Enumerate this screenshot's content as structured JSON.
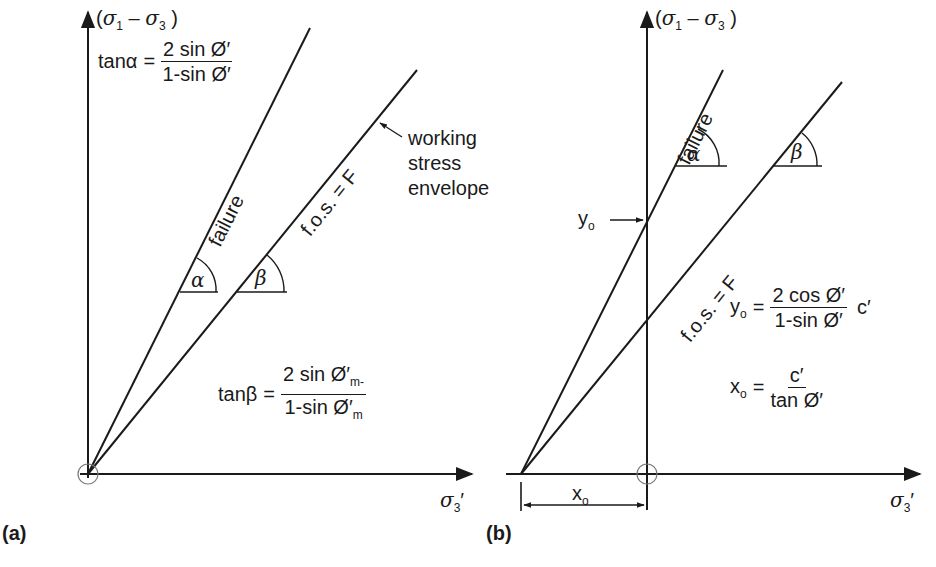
{
  "panels": {
    "a": {
      "label": "(a)",
      "y_axis_label": {
        "open": "(",
        "s1": "σ",
        "s1_sub": "1",
        "minus": " – ",
        "s3": "σ",
        "s3_sub": "3",
        "close": " )"
      },
      "x_axis_label": {
        "sym": "σ",
        "sub": "3",
        "prime": "′"
      },
      "failure_label": "failure",
      "fos_label": "f.o.s. = F",
      "annotation": [
        "working",
        "stress",
        "envelope"
      ],
      "alpha_label": "α",
      "beta_label": "β",
      "eq_alpha": {
        "lhs": "tanα",
        "eq": "=",
        "num": "2 sin Ø′",
        "den": "1-sin Ø′"
      },
      "eq_beta": {
        "lhs": "tanβ",
        "eq": "=",
        "num": "2 sin Ø′",
        "num_sub": "m-",
        "den": "1-sin Ø′",
        "den_sub": "m"
      }
    },
    "b": {
      "label": "(b)",
      "y_axis_label": {
        "open": "(",
        "s1": "σ",
        "s1_sub": "1",
        "minus": " – ",
        "s3": "σ",
        "s3_sub": "3",
        "close": " )"
      },
      "x_axis_label": {
        "sym": "σ",
        "sub": "3",
        "prime": "′"
      },
      "failure_label": "failure",
      "fos_label": "f.o.s. = F",
      "alpha_label": "α",
      "beta_label": "β",
      "yo_label": "y",
      "yo_sub": "o",
      "xo_label": "x",
      "xo_sub": "o",
      "eq_yo": {
        "lhs": "y",
        "lhs_sub": "o",
        "eq": "=",
        "num": "2 cos Ø′",
        "den": "1-sin Ø′",
        "tail": "c′"
      },
      "eq_xo": {
        "lhs": "x",
        "lhs_sub": "o",
        "eq": "=",
        "num": "c′",
        "den": "tan Ø′"
      }
    }
  },
  "colors": {
    "ink": "#1a1a1a",
    "circle": "#7a7a7a",
    "background": "#ffffff"
  }
}
